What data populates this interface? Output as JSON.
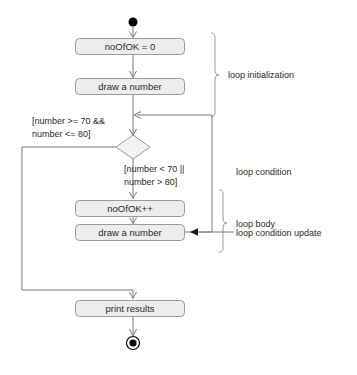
{
  "diagram": {
    "width": 357,
    "height": 375,
    "colors": {
      "background": "#ffffff",
      "box_fill": "#ededed",
      "box_stroke": "#9a9a9a",
      "edge_stroke": "#7a7a7a",
      "text": "#2a2a2a",
      "node_fill": "#000000"
    },
    "nodes": {
      "start": {
        "type": "initial-node",
        "cx": 133,
        "cy": 22,
        "r": 4.5
      },
      "action_init_counter": {
        "type": "action",
        "label": "noOfOK = 0",
        "x": 75,
        "y": 38,
        "w": 110,
        "h": 17
      },
      "action_draw_first": {
        "type": "action",
        "label": "draw a number",
        "x": 75,
        "y": 78,
        "w": 110,
        "h": 17
      },
      "decision": {
        "type": "decision",
        "cx": 133,
        "cy": 147,
        "rx": 17,
        "ry": 12
      },
      "action_increment": {
        "type": "action",
        "label": "noOfOK++",
        "x": 75,
        "y": 200,
        "w": 110,
        "h": 17
      },
      "action_draw_again": {
        "type": "action",
        "label": "draw a number",
        "x": 75,
        "y": 224,
        "w": 110,
        "h": 17
      },
      "action_print": {
        "type": "action",
        "label": "print results",
        "x": 75,
        "y": 300,
        "w": 110,
        "h": 17
      },
      "end": {
        "type": "final-node",
        "cx": 133,
        "cy": 343,
        "r_outer": 6.5,
        "r_inner": 3.5
      }
    },
    "guards": {
      "exit_guard": {
        "name": "exit-guard",
        "line1": "[number >= 70 &&",
        "line2": "number <= 80]",
        "x": 32,
        "y1": 121,
        "y2": 134
      },
      "loop_guard": {
        "name": "loop-guard",
        "line1": "[number < 70 ||",
        "line2": "number > 80]",
        "x": 124,
        "y1": 169,
        "y2": 182
      }
    },
    "annotations": [
      {
        "name": "loop-initialization",
        "label": "loop initialization",
        "x": 228,
        "y": 75,
        "brace": {
          "x": 212,
          "top": 33,
          "bottom": 117
        }
      },
      {
        "name": "loop-condition",
        "label": "loop condition",
        "x": 236,
        "y": 172,
        "brace": null
      },
      {
        "name": "loop-body",
        "label": "loop body",
        "x": 236,
        "y": 224,
        "brace": {
          "x": 220,
          "top": 190,
          "bottom": 252
        }
      },
      {
        "name": "loop-condition-update",
        "label": "loop condition update",
        "x": 236,
        "y": 238,
        "brace": null
      }
    ]
  }
}
